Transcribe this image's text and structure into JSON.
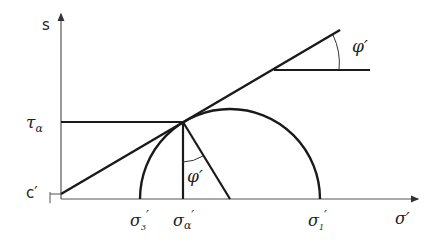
{
  "diagram": {
    "colors": {
      "line": "#1a1a1a",
      "axis": "#444444"
    },
    "labels": {
      "y_axis": "s",
      "x_axis": "σ′",
      "tau": "τ",
      "tau_sub": "α",
      "cohesion": "c′",
      "sigma3": "σ",
      "sigma3_sub": "3",
      "sigma_alpha": "σ",
      "sigma_alpha_sub": "α",
      "sigma1": "σ",
      "sigma1_sub": "1",
      "prime": "′",
      "phi_top": "φ′",
      "phi_inner": "φ′"
    }
  }
}
